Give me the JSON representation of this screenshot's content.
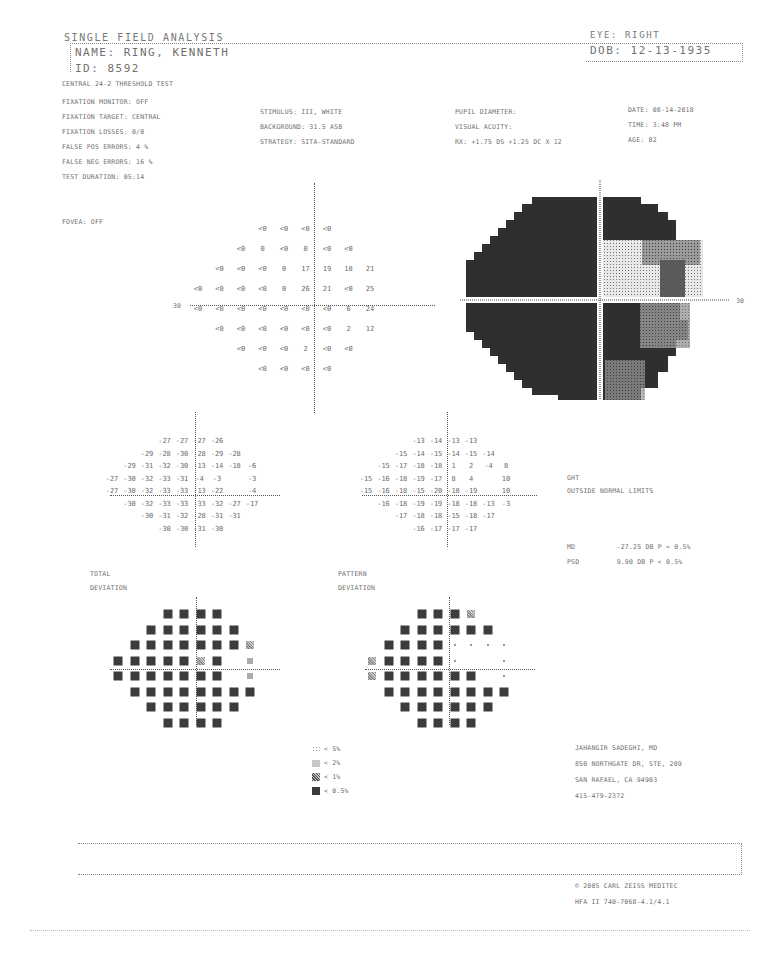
{
  "report": {
    "title": "SINGLE FIELD ANALYSIS",
    "eye": "EYE: RIGHT",
    "name": "NAME: RING, KENNETH",
    "dob": "DOB: 12-13-1935",
    "id": "ID: 8592",
    "test_name": "CENTRAL 24-2 THRESHOLD TEST"
  },
  "params": {
    "left": [
      "FIXATION MONITOR: OFF",
      "FIXATION TARGET: CENTRAL",
      "FIXATION LOSSES: 0/0",
      "FALSE POS ERRORS:  4 %",
      "FALSE NEG ERRORS:  16 %",
      "TEST DURATION: 05:14"
    ],
    "fovea": "FOVEA: OFF",
    "middle": [
      "STIMULUS: III, WHITE",
      "BACKGROUND: 31.5 ASB",
      "STRATEGY: SITA-STANDARD"
    ],
    "right_mid": [
      "PUPIL DIAMETER:",
      "VISUAL ACUITY:",
      "RX: +1.75 DS  +1.25 DC  X  12"
    ],
    "right": [
      "DATE: 08-14-2018",
      "TIME: 3:48 PM",
      "AGE: 82"
    ]
  },
  "threshold_plot": {
    "axis_label": "30",
    "rows": [
      [
        "<0",
        "<0",
        "<0",
        "<0"
      ],
      [
        "<0",
        "0",
        "<0",
        "0",
        "<0",
        "<0"
      ],
      [
        "<0",
        "<0",
        "<0",
        "0",
        "17",
        "19",
        "18",
        "21"
      ],
      [
        "<0",
        "<0",
        "<0",
        "<0",
        "0",
        "26",
        "21",
        "<0",
        "25"
      ],
      [
        "<0",
        "<0",
        "<0",
        "<0",
        "<0",
        "<0",
        "<0",
        "6",
        "24"
      ],
      [
        "<0",
        "<0",
        "<0",
        "<0",
        "<0",
        "<0",
        "2",
        "12"
      ],
      [
        "<0",
        "<0",
        "<0",
        "2",
        "<0",
        "<0"
      ],
      [
        "<0",
        "<0",
        "<0",
        "<0"
      ]
    ]
  },
  "grayscale_plot": {
    "axis_label": "30"
  },
  "total_deviation": {
    "label1": "TOTAL",
    "label2": "DEVIATION",
    "rows": [
      [
        "-27",
        "-27",
        "-27",
        "-26"
      ],
      [
        "-29",
        "-28",
        "-30",
        "-28",
        "-29",
        "-28"
      ],
      [
        "-29",
        "-31",
        "-32",
        "-30",
        "-13",
        "-14",
        "-18",
        "-6"
      ],
      [
        "-27",
        "-30",
        "-32",
        "-33",
        "-31",
        "-4",
        "-3",
        "",
        "-3"
      ],
      [
        "-27",
        "-30",
        "-32",
        "-33",
        "-33",
        "-13",
        "-22",
        "",
        "-4"
      ],
      [
        "-30",
        "-32",
        "-33",
        "-33",
        "-33",
        "-32",
        "-27",
        "-17"
      ],
      [
        "-30",
        "-31",
        "-32",
        "-28",
        "-31",
        "-31"
      ],
      [
        "-30",
        "-30",
        "-31",
        "-30"
      ]
    ]
  },
  "pattern_deviation": {
    "label1": "PATTERN",
    "label2": "DEVIATION",
    "rows": [
      [
        "-13",
        "-14",
        "-13",
        "-13"
      ],
      [
        "-15",
        "-14",
        "-15",
        "-14",
        "-15",
        "-14"
      ],
      [
        "-15",
        "-17",
        "-18",
        "-18",
        "1",
        "2",
        "-4",
        "8"
      ],
      [
        "-15",
        "-16",
        "-18",
        "-19",
        "-17",
        "8",
        "4",
        "",
        "10"
      ],
      [
        "-15",
        "-16",
        "-18",
        "-15",
        "-20",
        "-18",
        "-19",
        "",
        "10"
      ],
      [
        "-16",
        "-18",
        "-19",
        "-19",
        "-18",
        "-18",
        "-13",
        "-3"
      ],
      [
        "-17",
        "-18",
        "-18",
        "-15",
        "-18",
        "-17"
      ],
      [
        "-16",
        "-17",
        "-17",
        "-17"
      ]
    ]
  },
  "ght": {
    "label": "GHT",
    "value": "OUTSIDE NORMAL LIMITS",
    "md_label": "MD",
    "md_value": "-27.25 DB  P < 0.5%",
    "psd_label": "PSD",
    "psd_value": "9.90 DB  P < 0.5%"
  },
  "probability_maps": {
    "total": [
      [
        "s",
        "s",
        "s",
        "s"
      ],
      [
        "s",
        "s",
        "s",
        "s",
        "s",
        "s"
      ],
      [
        "s",
        "s",
        "s",
        "s",
        "s",
        "s",
        "s",
        "m2"
      ],
      [
        "s",
        "s",
        "s",
        "s",
        "s",
        "m2",
        "s",
        "",
        "m1"
      ],
      [
        "s",
        "s",
        "s",
        "s",
        "s",
        "s",
        "s",
        "",
        "m1"
      ],
      [
        "s",
        "s",
        "s",
        "s",
        "s",
        "s",
        "s",
        "s"
      ],
      [
        "s",
        "s",
        "s",
        "s",
        "s",
        "s"
      ],
      [
        "s",
        "s",
        "s",
        "s"
      ]
    ],
    "pattern": [
      [
        "s",
        "s",
        "s",
        "m2"
      ],
      [
        "s",
        "s",
        "s",
        "s",
        "s",
        "s"
      ],
      [
        "s",
        "s",
        "s",
        "s",
        "d",
        "d",
        "d",
        "d"
      ],
      [
        "m2",
        "s",
        "s",
        "s",
        "s",
        "d",
        "",
        "",
        "d"
      ],
      [
        "m2",
        "s",
        "s",
        "s",
        "s",
        "s",
        "s",
        "",
        "d"
      ],
      [
        "s",
        "s",
        "s",
        "s",
        "s",
        "s",
        "s",
        "s"
      ],
      [
        "s",
        "s",
        "s",
        "s",
        "s",
        "s"
      ],
      [
        "s",
        "s",
        "s",
        "s"
      ]
    ]
  },
  "legend": [
    {
      "symbol": "dots",
      "label": "< 5%"
    },
    {
      "symbol": "light",
      "label": "< 2%"
    },
    {
      "symbol": "medium",
      "label": "< 1%"
    },
    {
      "symbol": "solid",
      "label": "< 0.5%"
    }
  ],
  "doctor": [
    "JAHANGIR SADEGHI, MD",
    "850 NORTHGATE DR, STE, 209",
    "SAN RAFAEL, CA 94903",
    "415-479-2372"
  ],
  "footer": [
    "© 2005 CARL ZEISS MEDITEC",
    "HFA II 740-7068-4.1/4.1"
  ]
}
